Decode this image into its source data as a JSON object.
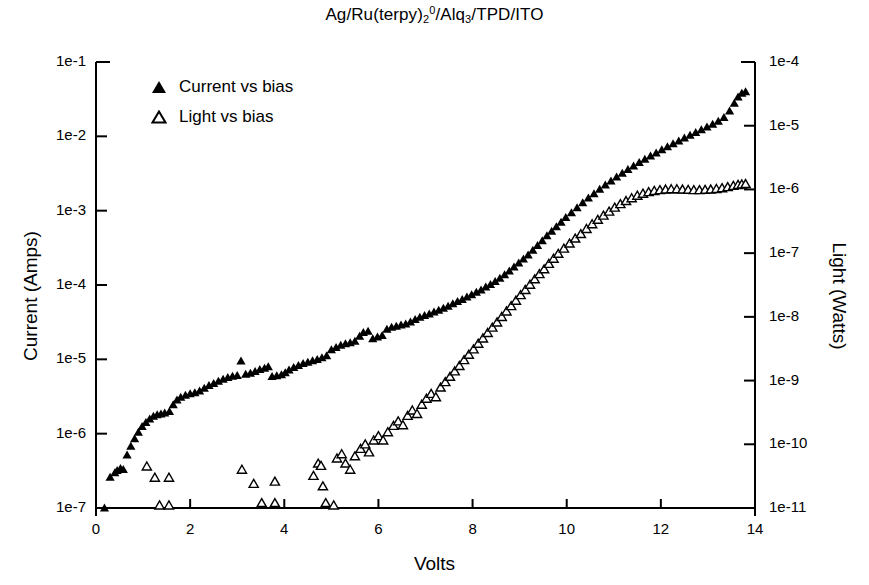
{
  "chart_data": {
    "type": "scatter",
    "title_parts": {
      "seg1": "Ag/Ru(terpy)",
      "sub1": "2",
      "sup1": "0",
      "seg2": "/Alq",
      "sub2": "3",
      "seg3": "/TPD/ITO"
    },
    "xlabel": "Volts",
    "ylabel": "Current (Amps)",
    "y2label": "Light (Watts)",
    "xlim": [
      0,
      14
    ],
    "ylim": [
      1e-07,
      0.1
    ],
    "y2lim": [
      1e-11,
      0.0001
    ],
    "xticks": [
      0,
      2,
      4,
      6,
      8,
      10,
      12,
      14
    ],
    "xtick_labels": [
      "0",
      "2",
      "4",
      "6",
      "8",
      "10",
      "12",
      "14"
    ],
    "yticks": [
      1e-07,
      1e-06,
      1e-05,
      0.0001,
      0.001,
      0.01,
      0.1
    ],
    "ytick_labels": [
      "1e-7",
      "1e-6",
      "1e-5",
      "1e-4",
      "1e-3",
      "1e-2",
      "1e-1"
    ],
    "y2ticks": [
      1e-11,
      1e-10,
      1e-09,
      1e-08,
      1e-07,
      1e-06,
      1e-05,
      0.0001
    ],
    "y2tick_labels": [
      "1e-11",
      "1e-10",
      "1e-9",
      "1e-8",
      "1e-7",
      "1e-6",
      "1e-5",
      "1e-4"
    ],
    "grid": false,
    "legend_position": "upper-left",
    "series": [
      {
        "name": "Current vs bias",
        "marker": "filled-triangle",
        "color": "#000000",
        "axis": "left",
        "points": [
          [
            0.18,
            1e-07
          ],
          [
            0.3,
            2.6e-07
          ],
          [
            0.4,
            3e-07
          ],
          [
            0.45,
            3.2e-07
          ],
          [
            0.52,
            3.4e-07
          ],
          [
            0.58,
            3.3e-07
          ],
          [
            0.66,
            5.2e-07
          ],
          [
            0.74,
            6.8e-07
          ],
          [
            0.82,
            8.6e-07
          ],
          [
            0.9,
            1.05e-06
          ],
          [
            0.98,
            1.25e-06
          ],
          [
            1.06,
            1.42e-06
          ],
          [
            1.14,
            1.58e-06
          ],
          [
            1.22,
            1.72e-06
          ],
          [
            1.3,
            1.8e-06
          ],
          [
            1.38,
            1.84e-06
          ],
          [
            1.46,
            1.9e-06
          ],
          [
            1.56,
            2e-06
          ],
          [
            1.64,
            2.45e-06
          ],
          [
            1.72,
            2.85e-06
          ],
          [
            1.8,
            3.1e-06
          ],
          [
            1.9,
            3.3e-06
          ],
          [
            2.0,
            3.45e-06
          ],
          [
            2.1,
            3.55e-06
          ],
          [
            2.2,
            3.75e-06
          ],
          [
            2.3,
            4.1e-06
          ],
          [
            2.4,
            4.45e-06
          ],
          [
            2.5,
            4.75e-06
          ],
          [
            2.6,
            5.1e-06
          ],
          [
            2.7,
            5.4e-06
          ],
          [
            2.8,
            5.7e-06
          ],
          [
            2.9,
            5.95e-06
          ],
          [
            3.0,
            6.1e-06
          ],
          [
            3.08,
            9.5e-06
          ],
          [
            3.18,
            6.3e-06
          ],
          [
            3.28,
            6.5e-06
          ],
          [
            3.38,
            6.9e-06
          ],
          [
            3.48,
            7.3e-06
          ],
          [
            3.58,
            7.6e-06
          ],
          [
            3.66,
            8e-06
          ],
          [
            3.74,
            5.9e-06
          ],
          [
            3.84,
            6.05e-06
          ],
          [
            3.94,
            6.2e-06
          ],
          [
            4.02,
            6.6e-06
          ],
          [
            4.1,
            7.2e-06
          ],
          [
            4.2,
            7.8e-06
          ],
          [
            4.3,
            8.3e-06
          ],
          [
            4.4,
            8.8e-06
          ],
          [
            4.5,
            9.2e-06
          ],
          [
            4.6,
            9.6e-06
          ],
          [
            4.7,
            1e-05
          ],
          [
            4.8,
            1.05e-05
          ],
          [
            4.9,
            1.12e-05
          ],
          [
            5.0,
            1.35e-05
          ],
          [
            5.1,
            1.45e-05
          ],
          [
            5.2,
            1.55e-05
          ],
          [
            5.3,
            1.62e-05
          ],
          [
            5.4,
            1.68e-05
          ],
          [
            5.5,
            1.75e-05
          ],
          [
            5.6,
            2.05e-05
          ],
          [
            5.68,
            2.3e-05
          ],
          [
            5.78,
            2.4e-05
          ],
          [
            5.88,
            1.9e-05
          ],
          [
            5.98,
            2e-05
          ],
          [
            6.08,
            2.1e-05
          ],
          [
            6.18,
            2.55e-05
          ],
          [
            6.28,
            2.7e-05
          ],
          [
            6.38,
            2.8e-05
          ],
          [
            6.48,
            2.9e-05
          ],
          [
            6.58,
            3e-05
          ],
          [
            6.68,
            3.2e-05
          ],
          [
            6.78,
            3.45e-05
          ],
          [
            6.88,
            3.7e-05
          ],
          [
            6.98,
            3.9e-05
          ],
          [
            7.08,
            4.1e-05
          ],
          [
            7.18,
            4.35e-05
          ],
          [
            7.28,
            4.6e-05
          ],
          [
            7.38,
            4.9e-05
          ],
          [
            7.48,
            5.2e-05
          ],
          [
            7.58,
            5.6e-05
          ],
          [
            7.68,
            6e-05
          ],
          [
            7.78,
            6.4e-05
          ],
          [
            7.88,
            6.9e-05
          ],
          [
            7.98,
            7.4e-05
          ],
          [
            8.08,
            8e-05
          ],
          [
            8.18,
            8.6e-05
          ],
          [
            8.28,
            9.4e-05
          ],
          [
            8.38,
            0.000102
          ],
          [
            8.48,
            0.000112
          ],
          [
            8.58,
            0.000124
          ],
          [
            8.68,
            0.000138
          ],
          [
            8.78,
            0.000155
          ],
          [
            8.88,
            0.000175
          ],
          [
            8.98,
            0.000198
          ],
          [
            9.08,
            0.000225
          ],
          [
            9.18,
            0.000255
          ],
          [
            9.28,
            0.000295
          ],
          [
            9.38,
            0.00034
          ],
          [
            9.48,
            0.000395
          ],
          [
            9.58,
            0.00046
          ],
          [
            9.68,
            0.00053
          ],
          [
            9.78,
            0.00061
          ],
          [
            9.88,
            0.0007
          ],
          [
            9.98,
            0.00081
          ],
          [
            10.1,
            0.00094
          ],
          [
            10.22,
            0.0011
          ],
          [
            10.34,
            0.00128
          ],
          [
            10.46,
            0.00148
          ],
          [
            10.58,
            0.0017
          ],
          [
            10.7,
            0.00195
          ],
          [
            10.82,
            0.00222
          ],
          [
            10.94,
            0.00252
          ],
          [
            11.06,
            0.00285
          ],
          [
            11.18,
            0.0032
          ],
          [
            11.3,
            0.0036
          ],
          [
            11.42,
            0.004
          ],
          [
            11.54,
            0.00445
          ],
          [
            11.66,
            0.00495
          ],
          [
            11.78,
            0.00545
          ],
          [
            11.9,
            0.006
          ],
          [
            12.02,
            0.0066
          ],
          [
            12.14,
            0.00725
          ],
          [
            12.26,
            0.00795
          ],
          [
            12.38,
            0.0087
          ],
          [
            12.5,
            0.0095
          ],
          [
            12.62,
            0.0104
          ],
          [
            12.74,
            0.0113
          ],
          [
            12.86,
            0.0123
          ],
          [
            12.98,
            0.0134
          ],
          [
            13.1,
            0.0146
          ],
          [
            13.22,
            0.016
          ],
          [
            13.34,
            0.018
          ],
          [
            13.46,
            0.022
          ],
          [
            13.56,
            0.028
          ],
          [
            13.64,
            0.034
          ],
          [
            13.72,
            0.038
          ],
          [
            13.8,
            0.04
          ]
        ]
      },
      {
        "name": "Light vs bias",
        "marker": "open-triangle",
        "color": "#000000",
        "axis": "right",
        "points": [
          [
            1.08,
            4.5e-11
          ],
          [
            1.25,
            3e-11
          ],
          [
            1.35,
            1.1e-11
          ],
          [
            1.55,
            1.1e-11
          ],
          [
            1.55,
            3e-11
          ],
          [
            3.1,
            4e-11
          ],
          [
            3.35,
            2.4e-11
          ],
          [
            3.52,
            1.2e-11
          ],
          [
            3.8,
            1.2e-11
          ],
          [
            3.8,
            2.6e-11
          ],
          [
            4.62,
            3.2e-11
          ],
          [
            4.72,
            5e-11
          ],
          [
            4.78,
            4.6e-11
          ],
          [
            4.82,
            2.2e-11
          ],
          [
            4.88,
            1.2e-11
          ],
          [
            5.05,
            1.1e-11
          ],
          [
            5.12,
            6e-11
          ],
          [
            5.22,
            7e-11
          ],
          [
            5.3,
            5e-11
          ],
          [
            5.4,
            4e-11
          ],
          [
            5.5,
            6.5e-11
          ],
          [
            5.62,
            8.5e-11
          ],
          [
            5.72,
            1e-10
          ],
          [
            5.8,
            7.5e-11
          ],
          [
            5.9,
            1.15e-10
          ],
          [
            6.0,
            1.35e-10
          ],
          [
            6.1,
            1.15e-10
          ],
          [
            6.2,
            1.55e-10
          ],
          [
            6.32,
            1.95e-10
          ],
          [
            6.42,
            2.3e-10
          ],
          [
            6.52,
            2e-10
          ],
          [
            6.62,
            2.8e-10
          ],
          [
            6.72,
            3.4e-10
          ],
          [
            6.82,
            3e-10
          ],
          [
            6.92,
            4.2e-10
          ],
          [
            7.02,
            5.2e-10
          ],
          [
            7.12,
            6.2e-10
          ],
          [
            7.22,
            5.5e-10
          ],
          [
            7.32,
            7.8e-10
          ],
          [
            7.42,
            9.5e-10
          ],
          [
            7.52,
            1.15e-09
          ],
          [
            7.62,
            1.4e-09
          ],
          [
            7.72,
            1.7e-09
          ],
          [
            7.82,
            2.1e-09
          ],
          [
            7.92,
            2.55e-09
          ],
          [
            8.02,
            3.1e-09
          ],
          [
            8.12,
            3.8e-09
          ],
          [
            8.22,
            4.6e-09
          ],
          [
            8.32,
            5.6e-09
          ],
          [
            8.42,
            6.8e-09
          ],
          [
            8.52,
            8.2e-09
          ],
          [
            8.62,
            1e-08
          ],
          [
            8.72,
            1.22e-08
          ],
          [
            8.82,
            1.48e-08
          ],
          [
            8.92,
            1.8e-08
          ],
          [
            9.02,
            2.2e-08
          ],
          [
            9.12,
            2.65e-08
          ],
          [
            9.22,
            3.2e-08
          ],
          [
            9.32,
            3.9e-08
          ],
          [
            9.42,
            4.7e-08
          ],
          [
            9.52,
            5.6e-08
          ],
          [
            9.62,
            6.8e-08
          ],
          [
            9.72,
            8.2e-08
          ],
          [
            9.82,
            9.8e-08
          ],
          [
            9.94,
            1.18e-07
          ],
          [
            10.06,
            1.42e-07
          ],
          [
            10.18,
            1.7e-07
          ],
          [
            10.3,
            2e-07
          ],
          [
            10.42,
            2.4e-07
          ],
          [
            10.54,
            2.85e-07
          ],
          [
            10.66,
            3.35e-07
          ],
          [
            10.78,
            3.9e-07
          ],
          [
            10.9,
            4.5e-07
          ],
          [
            11.02,
            5.2e-07
          ],
          [
            11.14,
            5.9e-07
          ],
          [
            11.26,
            6.6e-07
          ],
          [
            11.38,
            7.3e-07
          ],
          [
            11.5,
            8e-07
          ],
          [
            11.62,
            8.6e-07
          ],
          [
            11.74,
            9.1e-07
          ],
          [
            11.86,
            9.5e-07
          ],
          [
            11.98,
            9.8e-07
          ],
          [
            12.1,
            1e-06
          ],
          [
            12.22,
            1.01e-06
          ],
          [
            12.34,
            1.01e-06
          ],
          [
            12.46,
            1e-06
          ],
          [
            12.58,
            9.9e-07
          ],
          [
            12.7,
            9.8e-07
          ],
          [
            12.82,
            9.8e-07
          ],
          [
            12.94,
            9.9e-07
          ],
          [
            13.06,
            1e-06
          ],
          [
            13.18,
            1.02e-06
          ],
          [
            13.3,
            1.05e-06
          ],
          [
            13.42,
            1.09e-06
          ],
          [
            13.54,
            1.14e-06
          ],
          [
            13.64,
            1.18e-06
          ],
          [
            13.72,
            1.2e-06
          ],
          [
            13.8,
            1.22e-06
          ]
        ]
      }
    ]
  },
  "legend": {
    "items": [
      {
        "label": "Current vs bias",
        "marker": "filled-triangle"
      },
      {
        "label": "Light vs bias",
        "marker": "open-triangle"
      }
    ]
  },
  "style": {
    "axis_color": "#000000",
    "marker_color": "#000000",
    "background": "#ffffff"
  }
}
